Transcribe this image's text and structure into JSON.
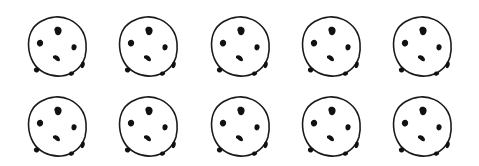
{
  "scene": {
    "description": "Ten chocolate chip cookies arranged in 2 rows of 5",
    "rows": 2,
    "columns": 5,
    "count": 10,
    "colors": {
      "background": "#ffffff",
      "outline": "#1a1a1a",
      "chip": "#111111"
    }
  },
  "cookies": [
    {
      "row": 0,
      "col": 0,
      "x": 25,
      "y": 13,
      "icon": "cookie-icon"
    },
    {
      "row": 0,
      "col": 1,
      "x": 116,
      "y": 13,
      "icon": "cookie-icon"
    },
    {
      "row": 0,
      "col": 2,
      "x": 208,
      "y": 13,
      "icon": "cookie-icon"
    },
    {
      "row": 0,
      "col": 3,
      "x": 299,
      "y": 13,
      "icon": "cookie-icon"
    },
    {
      "row": 0,
      "col": 4,
      "x": 390,
      "y": 13,
      "icon": "cookie-icon"
    },
    {
      "row": 1,
      "col": 0,
      "x": 25,
      "y": 93,
      "icon": "cookie-icon"
    },
    {
      "row": 1,
      "col": 1,
      "x": 116,
      "y": 93,
      "icon": "cookie-icon"
    },
    {
      "row": 1,
      "col": 2,
      "x": 208,
      "y": 93,
      "icon": "cookie-icon"
    },
    {
      "row": 1,
      "col": 3,
      "x": 299,
      "y": 93,
      "icon": "cookie-icon"
    },
    {
      "row": 1,
      "col": 4,
      "x": 390,
      "y": 93,
      "icon": "cookie-icon"
    }
  ]
}
